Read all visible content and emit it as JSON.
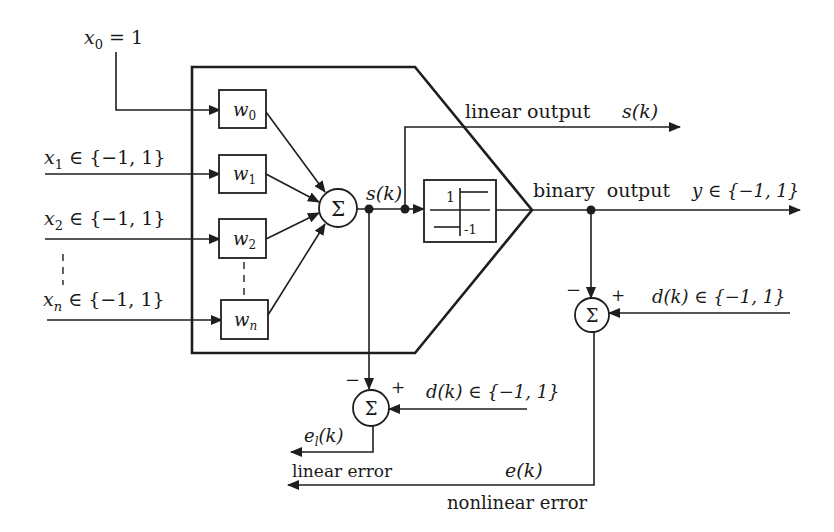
{
  "diagram": {
    "colors": {
      "ink": "#1e1e1e",
      "background": "#ffffff"
    },
    "inputs": [
      {
        "id": "x0",
        "label": "x",
        "sub": "0",
        "suffix": " = 1"
      },
      {
        "id": "x1",
        "label": "x",
        "sub": "1",
        "suffix": " ∈ {−1, 1}"
      },
      {
        "id": "x2",
        "label": "x",
        "sub": "2",
        "suffix": " ∈ {−1, 1}"
      },
      {
        "id": "xn",
        "label": "x",
        "sub": "n",
        "suffix": " ∈ {−1, 1}"
      }
    ],
    "weights": [
      {
        "id": "w0",
        "label": "w",
        "sub": "0"
      },
      {
        "id": "w1",
        "label": "w",
        "sub": "1"
      },
      {
        "id": "w2",
        "label": "w",
        "sub": "2"
      },
      {
        "id": "wn",
        "label": "w",
        "sub": "n"
      }
    ],
    "summer_symbol": "Σ",
    "sum_signal": "s(k)",
    "activation": {
      "high_label": "1",
      "low_label": "-1"
    },
    "linear_output": {
      "label": "linear output",
      "signal": "s(k)"
    },
    "binary_output": {
      "label": "binary  output",
      "signal": "y ∈ {−1, 1}"
    },
    "right_summer": {
      "minus": "−",
      "plus": "+",
      "desired": "d(k) ∈ {−1, 1}"
    },
    "bottom_summer": {
      "minus": "−",
      "plus": "+",
      "desired": "d(k) ∈ {−1, 1}"
    },
    "linear_error": {
      "signal_base": "e",
      "signal_sub": "l",
      "signal_tail": "(k)",
      "label": "linear error"
    },
    "nonlinear_error": {
      "signal": "e(k)",
      "label": "nonlinear error"
    }
  }
}
